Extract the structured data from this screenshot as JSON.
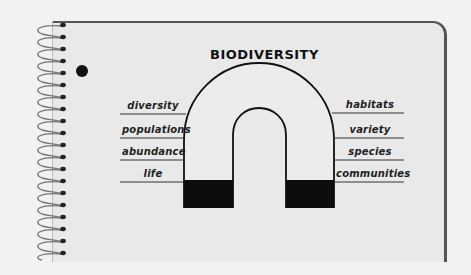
{
  "diagram": {
    "title": "BIODIVERSITY",
    "left_labels": [
      {
        "text": "diversity",
        "y": 114
      },
      {
        "text": "populations",
        "y": 138
      },
      {
        "text": "abundance",
        "y": 160
      },
      {
        "text": "life",
        "y": 182
      }
    ],
    "right_labels": [
      {
        "text": "habitats",
        "y": 113
      },
      {
        "text": "variety",
        "y": 138
      },
      {
        "text": "species",
        "y": 160
      },
      {
        "text": "communities",
        "y": 182
      }
    ],
    "shape": "horseshoe-magnet",
    "colors": {
      "paper": "#e9e9e9",
      "background": "#f2f2f2",
      "ink": "#111111",
      "border": "#555555"
    }
  }
}
